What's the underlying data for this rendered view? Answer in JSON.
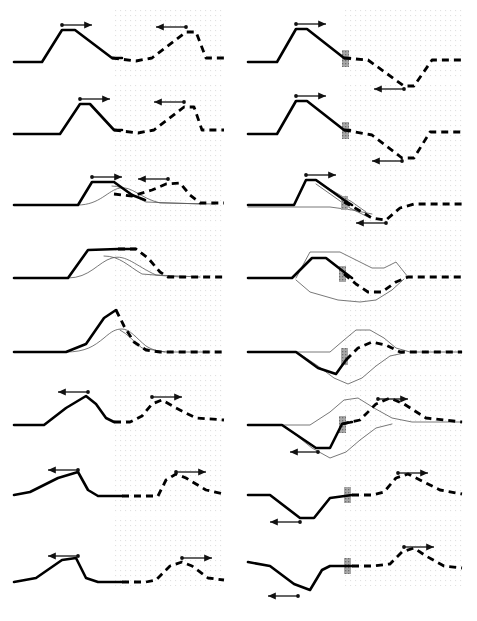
{
  "figure": {
    "name": "waveform-propagation-figure",
    "width": 477,
    "height": 621,
    "background_color": "#ffffff",
    "rows": 8,
    "columns": 2,
    "line_color": "#000000",
    "thin_curve_color": "#555555",
    "grid_dot_color": "#c8c8c8",
    "marker_bar_color": "#9a9a9a",
    "arrow_color": "#111111"
  },
  "layout": {
    "left_panel": {
      "x": 10,
      "width": 215,
      "grid_start_x": 114,
      "grid_end_x": 225
    },
    "right_panel": {
      "x": 243,
      "width": 222,
      "grid_start_x": 345,
      "grid_end_x": 465
    },
    "row_baselines": [
      62,
      134,
      205,
      278,
      352,
      425,
      495,
      568
    ],
    "grid_top_offset": -52,
    "grid_bottom_offset": 18,
    "grid_dot_spacing": 5
  },
  "panels": [
    {
      "id": "r1c1",
      "name": "panel-row1-left",
      "row": 1,
      "column": "left",
      "solid_path": "M 14 62 L 42 62 L 62 30 L 75 30 L 112 58 L 122 58",
      "dashed_path": "M 112 58 L 136 61 L 152 58 L 186 32 L 196 32 L 206 58 L 224 58",
      "thin_paths": [],
      "arrows": [
        {
          "name": "arrow-right",
          "x1": 62,
          "y1": 25,
          "x2": 92,
          "y2": 25,
          "direction": "right"
        },
        {
          "name": "arrow-left",
          "x1": 186,
          "y1": 27,
          "x2": 156,
          "y2": 27,
          "direction": "left"
        }
      ],
      "marker_bars": []
    },
    {
      "id": "r1c2",
      "name": "panel-row1-right",
      "row": 1,
      "column": "right",
      "solid_path": "M 248 62 L 277 62 L 296 29 L 307 29 L 344 58 L 350 58",
      "dashed_path": "M 344 58 L 368 60 L 404 86 L 414 86 L 432 60 L 462 60",
      "thin_paths": [],
      "arrows": [
        {
          "name": "arrow-right",
          "x1": 296,
          "y1": 24,
          "x2": 326,
          "y2": 24,
          "direction": "right"
        },
        {
          "name": "arrow-left",
          "x1": 404,
          "y1": 89,
          "x2": 374,
          "y2": 89,
          "direction": "left"
        }
      ],
      "marker_bars": [
        {
          "name": "marker-bar",
          "x": 342,
          "y": 50,
          "width": 7,
          "height": 17
        }
      ]
    },
    {
      "id": "r2c1",
      "name": "panel-row2-left",
      "row": 2,
      "column": "left",
      "solid_path": "M 14 134 L 60 134 L 80 104 L 90 104 L 114 130 L 122 130",
      "dashed_path": "M 114 130 L 138 133 L 154 130 L 184 107 L 194 107 L 202 130 L 224 130",
      "thin_paths": [],
      "arrows": [
        {
          "name": "arrow-right",
          "x1": 80,
          "y1": 99,
          "x2": 110,
          "y2": 99,
          "direction": "right"
        },
        {
          "name": "arrow-left",
          "x1": 184,
          "y1": 102,
          "x2": 154,
          "y2": 102,
          "direction": "left"
        }
      ],
      "marker_bars": []
    },
    {
      "id": "r2c2",
      "name": "panel-row2-right",
      "row": 2,
      "column": "right",
      "solid_path": "M 248 134 L 277 134 L 296 101 L 307 101 L 344 130 L 350 130",
      "dashed_path": "M 344 130 L 372 135 L 402 158 L 414 158 L 430 132 L 462 132",
      "thin_paths": [],
      "arrows": [
        {
          "name": "arrow-right",
          "x1": 296,
          "y1": 96,
          "x2": 326,
          "y2": 96,
          "direction": "right"
        },
        {
          "name": "arrow-left",
          "x1": 402,
          "y1": 161,
          "x2": 372,
          "y2": 161,
          "direction": "left"
        }
      ],
      "marker_bars": [
        {
          "name": "marker-bar",
          "x": 342,
          "y": 122,
          "width": 7,
          "height": 17
        }
      ]
    },
    {
      "id": "r3c1",
      "name": "panel-row3-left",
      "row": 3,
      "column": "left",
      "solid_path": "M 14 205 L 78 205 L 92 182 L 114 182 L 132 195 L 145 200",
      "dashed_path": "M 114 194 L 132 196 L 152 190 L 166 184 L 180 183 L 190 195 L 200 203 L 224 203",
      "thin_paths": [
        "M 78 205 C 100 205 108 190 120 188 C 132 186 140 198 160 203 L 215 204",
        "M 112 186 C 126 186 132 196 146 202 L 200 204"
      ],
      "arrows": [
        {
          "name": "arrow-right",
          "x1": 92,
          "y1": 177,
          "x2": 122,
          "y2": 177,
          "direction": "right"
        },
        {
          "name": "arrow-left",
          "x1": 168,
          "y1": 179,
          "x2": 138,
          "y2": 179,
          "direction": "left"
        }
      ],
      "marker_bars": []
    },
    {
      "id": "r3c2",
      "name": "panel-row3-right",
      "row": 3,
      "column": "right",
      "solid_path": "M 248 205 L 294 205 L 306 180 L 316 180 L 344 200 L 352 205",
      "dashed_path": "M 344 202 L 362 212 L 372 218 L 386 220 L 400 208 L 414 204 L 462 204",
      "thin_paths": [
        "M 248 207 L 296 207 L 330 207 L 352 210 L 372 214",
        "M 316 181 L 352 202 L 366 212",
        "M 316 184 L 350 208 L 370 218"
      ],
      "arrows": [
        {
          "name": "arrow-right",
          "x1": 306,
          "y1": 175,
          "x2": 336,
          "y2": 175,
          "direction": "right"
        },
        {
          "name": "arrow-left",
          "x1": 386,
          "y1": 223,
          "x2": 356,
          "y2": 223,
          "direction": "left"
        }
      ],
      "marker_bars": [
        {
          "name": "marker-bar",
          "x": 341,
          "y": 196,
          "width": 7,
          "height": 14
        }
      ]
    },
    {
      "id": "r4c1",
      "name": "panel-row4-left",
      "row": 4,
      "column": "left",
      "solid_path": "M 14 278 L 68 278 L 88 250 L 118 249 L 136 249",
      "dashed_path": "M 118 249 L 136 249 L 148 258 L 160 272 L 168 277 L 224 277",
      "thin_paths": [
        "M 68 278 C 90 278 98 262 112 258 C 126 254 136 266 156 275 L 200 277",
        "M 104 256 C 120 256 128 266 142 274 L 180 277"
      ],
      "arrows": [],
      "marker_bars": []
    },
    {
      "id": "r4c2",
      "name": "panel-row4-right",
      "row": 4,
      "column": "right",
      "solid_path": "M 248 278 L 292 278 L 312 258 L 326 258 L 344 272 L 352 278",
      "dashed_path": "M 344 274 L 356 284 L 368 292 L 382 292 L 396 282 L 408 277 L 462 277",
      "thin_paths": [
        "M 296 278 L 310 252 L 340 252 L 360 262 L 372 268 L 384 268 L 396 262 L 408 277",
        "M 296 280 L 310 292 L 338 300 L 360 302 L 376 300 L 392 290 L 404 279"
      ],
      "arrows": [],
      "marker_bars": [
        {
          "name": "marker-bar",
          "x": 339,
          "y": 266,
          "width": 7,
          "height": 16
        }
      ]
    },
    {
      "id": "r5c1",
      "name": "panel-row5-left",
      "row": 5,
      "column": "left",
      "solid_path": "M 14 352 L 66 352 L 86 344 L 104 318 L 116 310",
      "dashed_path": "M 116 310 L 124 326 L 134 342 L 146 350 L 160 352 L 224 352",
      "thin_paths": [
        "M 66 352 C 86 352 94 346 104 338 C 112 331 116 329 122 329 C 130 329 136 338 146 346 C 154 351 162 352 170 352 L 210 352",
        "M 120 330 C 128 334 134 342 142 348 L 165 352"
      ],
      "arrows": [],
      "marker_bars": []
    },
    {
      "id": "r5c2",
      "name": "panel-row5-right",
      "row": 5,
      "column": "right",
      "solid_path": "M 248 352 L 296 352 L 318 368 L 336 374 L 346 360",
      "dashed_path": "M 346 360 L 358 348 L 372 342 L 386 345 L 400 352 L 414 352 L 462 352",
      "thin_paths": [
        "M 296 352 L 330 352 L 344 340 L 356 330 L 370 330 L 384 338 L 396 348 L 410 352 L 462 352",
        "M 300 354 L 318 366 L 334 378 L 348 384 L 362 378 L 376 366 L 390 356 L 404 353"
      ],
      "arrows": [],
      "marker_bars": [
        {
          "name": "marker-bar",
          "x": 341,
          "y": 348,
          "width": 7,
          "height": 17
        }
      ]
    },
    {
      "id": "r6c1",
      "name": "panel-row6-left",
      "row": 6,
      "column": "left",
      "solid_path": "M 14 425 L 44 425 L 66 408 L 86 396 L 96 404 L 106 418 L 114 422",
      "dashed_path": "M 114 422 L 130 422 L 142 416 L 152 404 L 162 400 L 176 408 L 196 418 L 224 420",
      "thin_paths": [],
      "arrows": [
        {
          "name": "arrow-left",
          "x1": 88,
          "y1": 392,
          "x2": 58,
          "y2": 392,
          "direction": "left"
        },
        {
          "name": "arrow-right",
          "x1": 152,
          "y1": 397,
          "x2": 182,
          "y2": 397,
          "direction": "right"
        }
      ],
      "marker_bars": []
    },
    {
      "id": "r6c2",
      "name": "panel-row6-right",
      "row": 6,
      "column": "right",
      "solid_path": "M 248 425 L 282 425 L 316 448 L 330 448 L 342 424 L 352 422",
      "dashed_path": "M 342 424 L 360 420 L 376 404 L 390 398 L 404 404 L 426 418 L 462 422",
      "thin_paths": [
        "M 282 425 L 310 425 L 330 412 L 344 400 L 358 398 L 374 408 L 392 418 L 412 422 L 462 422",
        "M 286 427 L 312 448 L 330 458 L 346 452 L 360 440 L 376 428 L 392 424"
      ],
      "arrows": [
        {
          "name": "arrow-left",
          "x1": 318,
          "y1": 452,
          "x2": 290,
          "y2": 452,
          "direction": "left"
        },
        {
          "name": "arrow-right",
          "x1": 378,
          "y1": 399,
          "x2": 408,
          "y2": 399,
          "direction": "right"
        }
      ],
      "marker_bars": [
        {
          "name": "marker-bar",
          "x": 339,
          "y": 416,
          "width": 7,
          "height": 17
        }
      ]
    },
    {
      "id": "r7c1",
      "name": "panel-row7-left",
      "row": 7,
      "column": "left",
      "solid_path": "M 14 495 L 30 492 L 58 478 L 78 472 L 88 490 L 98 496 L 122 496",
      "dashed_path": "M 122 496 L 146 496 L 158 496 L 166 480 L 176 474 L 186 478 L 206 490 L 224 494",
      "thin_paths": [],
      "arrows": [
        {
          "name": "arrow-left",
          "x1": 78,
          "y1": 470,
          "x2": 48,
          "y2": 470,
          "direction": "left"
        },
        {
          "name": "arrow-right",
          "x1": 176,
          "y1": 472,
          "x2": 206,
          "y2": 472,
          "direction": "right"
        }
      ],
      "marker_bars": []
    },
    {
      "id": "r7c2",
      "name": "panel-row7-right",
      "row": 7,
      "column": "right",
      "solid_path": "M 248 495 L 270 495 L 300 518 L 314 518 L 330 498 L 352 495",
      "dashed_path": "M 352 495 L 372 495 L 384 492 L 396 478 L 408 474 L 420 480 L 440 490 L 462 494",
      "thin_paths": [],
      "arrows": [
        {
          "name": "arrow-left",
          "x1": 300,
          "y1": 522,
          "x2": 270,
          "y2": 522,
          "direction": "left"
        },
        {
          "name": "arrow-right",
          "x1": 398,
          "y1": 473,
          "x2": 428,
          "y2": 473,
          "direction": "right"
        }
      ],
      "marker_bars": [
        {
          "name": "marker-bar",
          "x": 344,
          "y": 487,
          "width": 7,
          "height": 16
        }
      ]
    },
    {
      "id": "r8c1",
      "name": "panel-row8-left",
      "row": 8,
      "column": "left",
      "solid_path": "M 14 582 L 36 578 L 62 560 L 76 558 L 86 578 L 98 582 L 122 582",
      "dashed_path": "M 122 582 L 146 582 L 156 580 L 170 566 L 182 562 L 192 566 L 208 578 L 224 580",
      "thin_paths": [],
      "arrows": [
        {
          "name": "arrow-left",
          "x1": 78,
          "y1": 556,
          "x2": 48,
          "y2": 556,
          "direction": "left"
        },
        {
          "name": "arrow-right",
          "x1": 182,
          "y1": 558,
          "x2": 212,
          "y2": 558,
          "direction": "right"
        }
      ],
      "marker_bars": []
    },
    {
      "id": "r8c2",
      "name": "panel-row8-right",
      "row": 8,
      "column": "right",
      "solid_path": "M 248 562 L 270 566 L 294 584 L 310 590 L 322 570 L 330 566 L 352 566",
      "dashed_path": "M 352 566 L 372 566 L 390 564 L 402 552 L 414 548 L 426 556 L 444 566 L 462 568",
      "thin_paths": [],
      "arrows": [
        {
          "name": "arrow-left",
          "x1": 298,
          "y1": 596,
          "x2": 268,
          "y2": 596,
          "direction": "left"
        },
        {
          "name": "arrow-right",
          "x1": 404,
          "y1": 547,
          "x2": 434,
          "y2": 547,
          "direction": "right"
        }
      ],
      "marker_bars": [
        {
          "name": "marker-bar",
          "x": 344,
          "y": 558,
          "width": 7,
          "height": 16
        }
      ]
    }
  ],
  "styles": {
    "solid_stroke_width": 2.6,
    "dashed_stroke_width": 2.8,
    "dash_pattern": "7 5",
    "thin_stroke_width": 0.8,
    "arrow_stroke_width": 1.3,
    "arrow_head_size": 4.5
  }
}
